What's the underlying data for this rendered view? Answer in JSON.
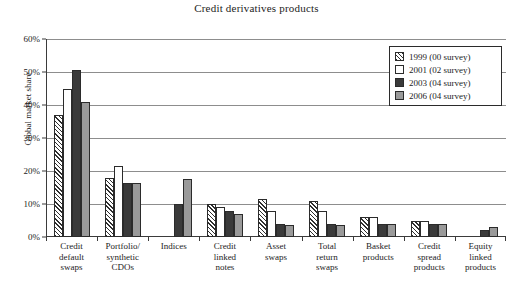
{
  "chart_data": {
    "type": "bar",
    "title": "Credit derivatives products",
    "xlabel": "",
    "ylabel": "Global market share",
    "ylim": [
      0,
      60
    ],
    "ytick_labels": [
      "0%",
      "10%",
      "20%",
      "30%",
      "40%",
      "50%",
      "60%"
    ],
    "ytick_values": [
      0,
      10,
      20,
      30,
      40,
      50,
      60
    ],
    "grid": true,
    "legend_position": "top-right",
    "categories": [
      "Credit default swaps",
      "Portfolio/ synthetic CDOs",
      "Indices",
      "Credit linked notes",
      "Asset swaps",
      "Total return swaps",
      "Basket products",
      "Credit spread products",
      "Equity linked products"
    ],
    "category_lines": [
      [
        "Credit",
        "default",
        "swaps"
      ],
      [
        "Portfolio/",
        "synthetic",
        "CDOs"
      ],
      [
        "Indices"
      ],
      [
        "Credit",
        "linked",
        "notes"
      ],
      [
        "Asset",
        "swaps"
      ],
      [
        "Total",
        "return",
        "swaps"
      ],
      [
        "Basket",
        "products"
      ],
      [
        "Credit",
        "spread",
        "products"
      ],
      [
        "Equity",
        "linked",
        "products"
      ]
    ],
    "series": [
      {
        "name": "1999 (00 survey)",
        "color": "#ffffff",
        "pattern": "diagonal-hatch",
        "values": [
          37,
          18,
          0,
          10,
          11.5,
          11,
          6,
          5,
          0
        ]
      },
      {
        "name": "2001 (02 survey)",
        "color": "#ffffff",
        "pattern": "solid",
        "values": [
          45,
          21.5,
          0,
          9,
          8,
          8,
          6,
          5,
          0
        ]
      },
      {
        "name": "2003 (04 survey)",
        "color": "#3a3a3a",
        "pattern": "solid",
        "values": [
          50.5,
          16.5,
          10,
          8,
          4,
          4,
          4,
          4,
          2
        ]
      },
      {
        "name": "2006 (04 survey)",
        "color": "#9a9a9a",
        "pattern": "solid",
        "values": [
          41,
          16.5,
          17.5,
          7,
          3.5,
          3.5,
          4,
          4,
          3
        ]
      }
    ]
  },
  "legend": {
    "items": [
      {
        "label": "1999 (00 survey)"
      },
      {
        "label": "2001 (02 survey)"
      },
      {
        "label": "2003 (04 survey)"
      },
      {
        "label": "2006 (04 survey)"
      }
    ]
  }
}
